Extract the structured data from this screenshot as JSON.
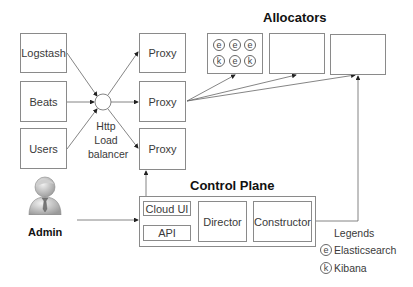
{
  "inputs": [
    {
      "id": "logstash",
      "label": "Logstash"
    },
    {
      "id": "beats",
      "label": "Beats"
    },
    {
      "id": "users",
      "label": "Users"
    }
  ],
  "load_balancer": {
    "lines": [
      "Http",
      "Load",
      "balancer"
    ]
  },
  "proxies": [
    {
      "label": "Proxy"
    },
    {
      "label": "Proxy"
    },
    {
      "label": "Proxy"
    }
  ],
  "allocators": {
    "title": "Allocators",
    "boxes": [
      {
        "nodes": [
          "e",
          "e",
          "e",
          "k",
          "e",
          "k"
        ]
      },
      {
        "nodes": []
      },
      {
        "nodes": []
      }
    ]
  },
  "control_plane": {
    "title": "Control Plane",
    "components": {
      "cloud_ui": "Cloud UI",
      "api": "API",
      "director": "Director",
      "constructor": "Constructor"
    }
  },
  "admin": {
    "label": "Admin",
    "icon": "user-icon"
  },
  "legend": {
    "title": "Legends",
    "items": [
      {
        "symbol": "e",
        "label": "Elasticsearch"
      },
      {
        "symbol": "k",
        "label": "Kibana"
      }
    ]
  },
  "colors": {
    "stroke": "#8a8a8a",
    "arrow": "#222222",
    "text": "#3a3a3a"
  }
}
